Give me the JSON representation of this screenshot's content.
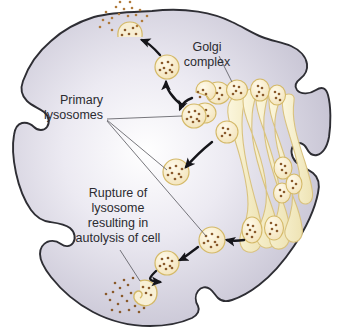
{
  "figure": {
    "type": "biology-diagram",
    "background_color": "#ffffff"
  },
  "cell": {
    "name": "cell",
    "fill_outer": "#c7c4d4",
    "fill_inner": "#ffffff",
    "stroke": "#2e2e34"
  },
  "labels": {
    "golgi": {
      "lines": [
        "Golgi",
        "complex"
      ],
      "line1": "Golgi",
      "line2": "complex"
    },
    "primary_lysosomes": {
      "lines": [
        "Primary",
        "lysosomes"
      ],
      "line1": "Primary",
      "line2": "lysosomes"
    },
    "rupture": {
      "lines": [
        "Rupture of",
        "lysosome",
        "resulting in",
        "autolysis of cell"
      ],
      "line1": "Rupture of",
      "line2": "lysosome",
      "line3": "resulting in",
      "line4": "autolysis of cell"
    }
  },
  "colors": {
    "vesicle_fill": "#faf0d2",
    "vesicle_stroke": "#d4b968",
    "granule": "#8a5a2b",
    "golgi_fill": "#f7efcd",
    "golgi_stroke": "#d9c27f",
    "text": "#2b2b30",
    "leader": "#55555c",
    "arrow": "#15151a"
  },
  "structures": {
    "golgi_cisternae_count": 6,
    "primary_lysosome_count": 8,
    "exocytosis_site": "top membrane",
    "autolysis_site": "bottom left"
  }
}
